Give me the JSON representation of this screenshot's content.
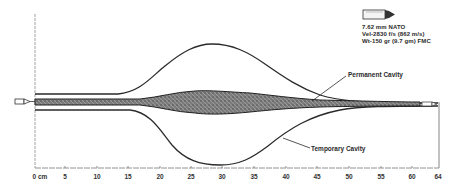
{
  "bullet_info": {
    "caliber": "7.62 mm NATO",
    "velocity": "Vel-2830 f/s (862 m/s)",
    "weight": "Wt-150 gr (9.7 gm) FMC"
  },
  "labels": {
    "permanent_cavity": "Permanent Cavity",
    "temporary_cavity": "Temporary Cavity"
  },
  "axis": {
    "ticks": [
      {
        "label": "0 cm",
        "x": 40
      },
      {
        "label": "5",
        "x": 65
      },
      {
        "label": "10",
        "x": 97
      },
      {
        "label": "15",
        "x": 128
      },
      {
        "label": "20",
        "x": 160
      },
      {
        "label": "25",
        "x": 191
      },
      {
        "label": "30",
        "x": 222
      },
      {
        "label": "35",
        "x": 254
      },
      {
        "label": "40",
        "x": 286
      },
      {
        "label": "45",
        "x": 317
      },
      {
        "label": "50",
        "x": 349
      },
      {
        "label": "55",
        "x": 381
      },
      {
        "label": "60",
        "x": 412
      },
      {
        "label": "64",
        "x": 438
      }
    ],
    "unit": "cm",
    "range": [
      0,
      64
    ]
  },
  "colors": {
    "line": "#2a2a2a",
    "stipple": "#555555",
    "background": "#ffffff"
  }
}
